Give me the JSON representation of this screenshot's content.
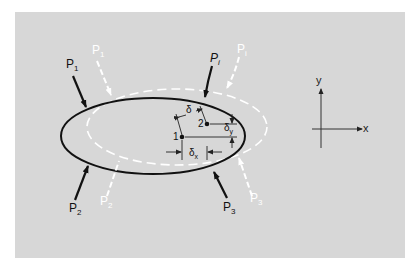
{
  "figure": {
    "background_color": "#d7d7d7",
    "page_color": "#ffffff",
    "body_original": {
      "stroke": "#111111",
      "point_label": "1"
    },
    "body_displaced": {
      "stroke": "#ffffff",
      "style": "dashed",
      "point_label": "2"
    },
    "loads_original": [
      {
        "label": "P",
        "sub": "1"
      },
      {
        "label": "P",
        "sub": "2"
      },
      {
        "label": "P",
        "sub": "3"
      },
      {
        "label": "P",
        "sub": "i"
      }
    ],
    "loads_displaced": [
      {
        "label": "P",
        "sub": "1"
      },
      {
        "label": "P",
        "sub": "2"
      },
      {
        "label": "P",
        "sub": "3"
      },
      {
        "label": "P",
        "sub": "i"
      }
    ],
    "displacements": {
      "total": "δ",
      "x": "δ",
      "x_sub": "x",
      "y": "δ",
      "y_sub": "y"
    },
    "axes": {
      "x_label": "x",
      "y_label": "y"
    }
  }
}
